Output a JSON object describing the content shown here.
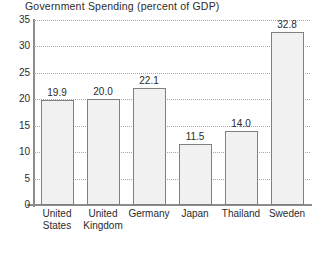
{
  "chart_data": {
    "type": "bar",
    "title": "Government Spending (percent of GDP)",
    "xlabel": "",
    "ylabel": "",
    "categories": [
      "United States",
      "United Kingdom",
      "Germany",
      "Japan",
      "Thailand",
      "Sweden"
    ],
    "category_lines": [
      [
        "United",
        "States"
      ],
      [
        "United",
        "Kingdom"
      ],
      [
        "Germany",
        ""
      ],
      [
        "Japan",
        ""
      ],
      [
        "Thailand",
        ""
      ],
      [
        "Sweden",
        ""
      ]
    ],
    "values": [
      19.9,
      20.0,
      22.1,
      11.5,
      14.0,
      32.8
    ],
    "value_labels": [
      "19.9",
      "20.0",
      "22.1",
      "11.5",
      "14.0",
      "32.8"
    ],
    "ylim": [
      0,
      35
    ],
    "yticks": [
      0,
      5,
      10,
      15,
      20,
      25,
      30,
      35
    ],
    "ytick_labels": [
      "0",
      "5",
      "10",
      "15",
      "20",
      "25",
      "30",
      "35"
    ],
    "grid": true,
    "grid_style": "dotted",
    "legend": "none",
    "colors": {
      "bar_fill": "#f1f1f1",
      "bar_border": "#808080",
      "axis": "#8c8c8c",
      "grid": "#a8a8a8",
      "text": "#2b2b2b",
      "background": "#ffffff"
    }
  }
}
